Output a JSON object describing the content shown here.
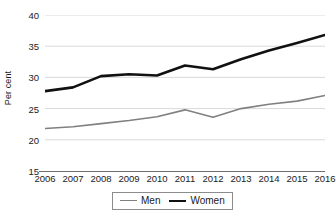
{
  "chart_data": {
    "type": "line",
    "title": "",
    "xlabel": "",
    "ylabel": "Per cent",
    "categories": [
      "2006",
      "2007",
      "2008",
      "2009",
      "2010",
      "2011",
      "2012",
      "2013",
      "2014",
      "2015",
      "2016"
    ],
    "series": [
      {
        "name": "Men",
        "color": "#808080",
        "values": [
          21.8,
          22.1,
          22.6,
          23.1,
          23.7,
          24.8,
          23.6,
          25.0,
          25.7,
          26.2,
          27.1
        ]
      },
      {
        "name": "Women",
        "color": "#111111",
        "values": [
          27.8,
          28.4,
          30.2,
          30.5,
          30.3,
          31.9,
          31.3,
          32.9,
          34.3,
          35.5,
          36.8
        ]
      }
    ],
    "ylim": [
      15,
      40
    ],
    "yticks": [
      15,
      20,
      25,
      30,
      35,
      40
    ],
    "ytick_labels": [
      "15",
      "20",
      "25",
      "30",
      "35",
      "40"
    ],
    "grid": "horizontal",
    "gridline_color": "#d9d9d9",
    "axis_color": "#6e6e6e",
    "legend_position": "bottom-center",
    "legend_entries": [
      "Men",
      "Women"
    ],
    "background": "#ffffff"
  }
}
